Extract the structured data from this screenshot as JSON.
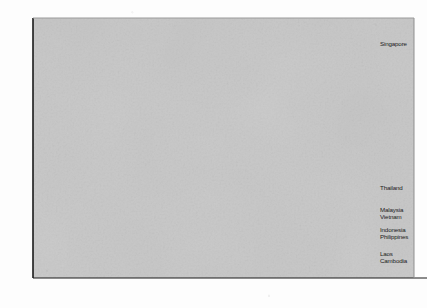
{
  "figure": {
    "title_partial": "Ageing",
    "background_plot_color": "#c9c9c9",
    "gridline_color": "#4a4a4a",
    "axis_color": "#1a1a1a"
  },
  "chart_data": {
    "type": "line",
    "title": "",
    "xlabel": "",
    "ylabel": "",
    "xlim": [
      1945,
      2055
    ],
    "ylim": [
      0,
      40
    ],
    "ytick_step": 5,
    "yticks": [
      "0",
      "5",
      "10",
      "15",
      "20",
      "25",
      "30",
      "35",
      "40"
    ],
    "xticks": [
      "1950",
      "1975",
      "2000",
      "2025",
      "2050"
    ],
    "grid": "horizontal",
    "legend_position": "right-inline-labels",
    "x": [
      1950,
      1960,
      1970,
      1975,
      1985,
      1995,
      2000,
      2005,
      2010,
      2015,
      2020,
      2025,
      2030,
      2035,
      2040,
      2045,
      2050
    ],
    "series": [
      {
        "name": "Singapore",
        "color": "#1a1a1a",
        "width": 1.9,
        "label_value": "35",
        "values": [
          2.7,
          2.0,
          1.5,
          1.5,
          2.1,
          3.3,
          4.0,
          4.3,
          4.2,
          3.2,
          3.6,
          5.0,
          8.0,
          13.0,
          20.0,
          28.0,
          35.0
        ]
      },
      {
        "name": "Thailand",
        "color": "#8a8a8a",
        "width": 1.3,
        "label_value": "13",
        "values": [
          1.9,
          1.6,
          1.3,
          1.3,
          1.6,
          2.0,
          2.2,
          2.3,
          2.4,
          2.6,
          3.0,
          3.9,
          5.5,
          7.3,
          9.3,
          11.2,
          13.0
        ]
      },
      {
        "name": "Malaysia",
        "color": "#6f6f6f",
        "width": 1.3,
        "label_value": "9.6",
        "values": [
          1.6,
          1.4,
          1.2,
          1.2,
          1.4,
          1.7,
          1.9,
          2.0,
          2.1,
          2.3,
          2.7,
          3.3,
          4.3,
          5.5,
          6.9,
          8.3,
          9.6
        ]
      },
      {
        "name": "Vietnam",
        "color": "#2b2b2b",
        "width": 1.5,
        "label_value": "8.8",
        "values": [
          1.5,
          1.3,
          1.1,
          1.1,
          1.4,
          1.8,
          2.0,
          2.1,
          2.2,
          2.5,
          3.0,
          3.6,
          4.5,
          5.6,
          6.7,
          7.8,
          8.8
        ]
      },
      {
        "name": "Indonesia",
        "color": "#555555",
        "width": 1.2,
        "label_value": "6.0",
        "values": [
          1.3,
          1.2,
          1.0,
          1.0,
          1.2,
          1.5,
          1.6,
          1.7,
          1.8,
          2.0,
          2.3,
          2.8,
          3.4,
          4.1,
          4.8,
          5.4,
          6.0
        ]
      },
      {
        "name": "Philippines",
        "color": "#777777",
        "width": 1.2,
        "label_value": "5.2",
        "values": [
          1.2,
          1.1,
          1.0,
          1.0,
          1.1,
          1.3,
          1.4,
          1.5,
          1.6,
          1.8,
          2.1,
          2.5,
          3.0,
          3.6,
          4.2,
          4.7,
          5.2
        ]
      },
      {
        "name": "Laos",
        "color": "#3d3d3d",
        "width": 1.2,
        "label_value": "3.0",
        "values": [
          1.0,
          0.95,
          0.9,
          0.9,
          0.95,
          1.05,
          1.1,
          1.15,
          1.2,
          1.3,
          1.5,
          1.7,
          2.0,
          2.3,
          2.55,
          2.8,
          3.0
        ]
      },
      {
        "name": "Cambodia",
        "color": "#202020",
        "width": 1.4,
        "label_value": "2.7",
        "values": [
          0.85,
          0.85,
          0.85,
          0.85,
          0.85,
          0.9,
          0.95,
          1.0,
          1.05,
          1.15,
          1.3,
          1.5,
          1.75,
          2.0,
          2.25,
          2.5,
          2.7
        ]
      }
    ],
    "series_label_order": [
      "Singapore",
      "Thailand",
      "Malaysia",
      "Vietnam",
      "Indonesia",
      "Philippines",
      "Laos",
      "Cambodia"
    ]
  }
}
